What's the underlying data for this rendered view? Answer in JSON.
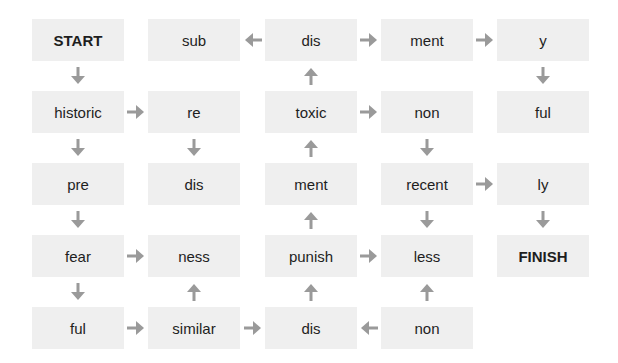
{
  "puzzle": {
    "title": "Word maze",
    "cells": [
      {
        "row": 0,
        "col": 0,
        "text": "START",
        "bold": true
      },
      {
        "row": 0,
        "col": 1,
        "text": "sub"
      },
      {
        "row": 0,
        "col": 2,
        "text": "dis"
      },
      {
        "row": 0,
        "col": 3,
        "text": "ment"
      },
      {
        "row": 0,
        "col": 4,
        "text": "y"
      },
      {
        "row": 1,
        "col": 0,
        "text": "historic"
      },
      {
        "row": 1,
        "col": 1,
        "text": "re"
      },
      {
        "row": 1,
        "col": 2,
        "text": "toxic"
      },
      {
        "row": 1,
        "col": 3,
        "text": "non"
      },
      {
        "row": 1,
        "col": 4,
        "text": "ful"
      },
      {
        "row": 2,
        "col": 0,
        "text": "pre"
      },
      {
        "row": 2,
        "col": 1,
        "text": "dis"
      },
      {
        "row": 2,
        "col": 2,
        "text": "ment"
      },
      {
        "row": 2,
        "col": 3,
        "text": "recent"
      },
      {
        "row": 2,
        "col": 4,
        "text": "ly"
      },
      {
        "row": 3,
        "col": 0,
        "text": "fear"
      },
      {
        "row": 3,
        "col": 1,
        "text": "ness"
      },
      {
        "row": 3,
        "col": 2,
        "text": "punish"
      },
      {
        "row": 3,
        "col": 3,
        "text": "less"
      },
      {
        "row": 3,
        "col": 4,
        "text": "FINISH",
        "bold": true
      },
      {
        "row": 4,
        "col": 0,
        "text": "ful"
      },
      {
        "row": 4,
        "col": 1,
        "text": "similar"
      },
      {
        "row": 4,
        "col": 2,
        "text": "dis"
      },
      {
        "row": 4,
        "col": 3,
        "text": "non"
      }
    ],
    "arrows": [
      {
        "from": [
          0,
          2
        ],
        "to": [
          0,
          1
        ],
        "dir": "left"
      },
      {
        "from": [
          0,
          2
        ],
        "to": [
          0,
          3
        ],
        "dir": "right"
      },
      {
        "from": [
          0,
          3
        ],
        "to": [
          0,
          4
        ],
        "dir": "right"
      },
      {
        "from": [
          0,
          0
        ],
        "to": [
          1,
          0
        ],
        "dir": "down"
      },
      {
        "from": [
          1,
          2
        ],
        "to": [
          0,
          2
        ],
        "dir": "up"
      },
      {
        "from": [
          0,
          4
        ],
        "to": [
          1,
          4
        ],
        "dir": "down"
      },
      {
        "from": [
          1,
          0
        ],
        "to": [
          1,
          1
        ],
        "dir": "right"
      },
      {
        "from": [
          1,
          2
        ],
        "to": [
          1,
          3
        ],
        "dir": "right"
      },
      {
        "from": [
          1,
          0
        ],
        "to": [
          2,
          0
        ],
        "dir": "down"
      },
      {
        "from": [
          1,
          1
        ],
        "to": [
          2,
          1
        ],
        "dir": "down"
      },
      {
        "from": [
          2,
          2
        ],
        "to": [
          1,
          2
        ],
        "dir": "up"
      },
      {
        "from": [
          1,
          3
        ],
        "to": [
          2,
          3
        ],
        "dir": "down"
      },
      {
        "from": [
          2,
          3
        ],
        "to": [
          2,
          4
        ],
        "dir": "right"
      },
      {
        "from": [
          2,
          0
        ],
        "to": [
          3,
          0
        ],
        "dir": "down"
      },
      {
        "from": [
          3,
          2
        ],
        "to": [
          2,
          2
        ],
        "dir": "up"
      },
      {
        "from": [
          2,
          3
        ],
        "to": [
          3,
          3
        ],
        "dir": "down"
      },
      {
        "from": [
          2,
          4
        ],
        "to": [
          3,
          4
        ],
        "dir": "down"
      },
      {
        "from": [
          3,
          0
        ],
        "to": [
          3,
          1
        ],
        "dir": "right"
      },
      {
        "from": [
          3,
          2
        ],
        "to": [
          3,
          3
        ],
        "dir": "right"
      },
      {
        "from": [
          3,
          0
        ],
        "to": [
          4,
          0
        ],
        "dir": "down"
      },
      {
        "from": [
          4,
          1
        ],
        "to": [
          3,
          1
        ],
        "dir": "up"
      },
      {
        "from": [
          4,
          2
        ],
        "to": [
          3,
          2
        ],
        "dir": "up"
      },
      {
        "from": [
          4,
          3
        ],
        "to": [
          3,
          3
        ],
        "dir": "up"
      },
      {
        "from": [
          4,
          0
        ],
        "to": [
          4,
          1
        ],
        "dir": "right"
      },
      {
        "from": [
          4,
          1
        ],
        "to": [
          4,
          2
        ],
        "dir": "right"
      },
      {
        "from": [
          4,
          3
        ],
        "to": [
          4,
          2
        ],
        "dir": "left"
      }
    ]
  },
  "colors": {
    "box_bg": "#efefef",
    "arrow": "#9a9a9a",
    "text": "#1e1e1e"
  }
}
